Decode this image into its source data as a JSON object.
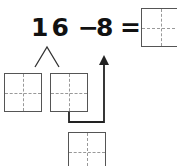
{
  "equation": {
    "minuend": "16",
    "operator": "−",
    "subtrahend": "8",
    "equals": "="
  },
  "boxes": [
    {
      "id": "answer",
      "label": ""
    },
    {
      "id": "split-left",
      "label": ""
    },
    {
      "id": "split-right",
      "label": ""
    },
    {
      "id": "bottom",
      "label": ""
    }
  ],
  "colors": {
    "text": "#111111",
    "box": "#555555",
    "guide": "#999999"
  }
}
